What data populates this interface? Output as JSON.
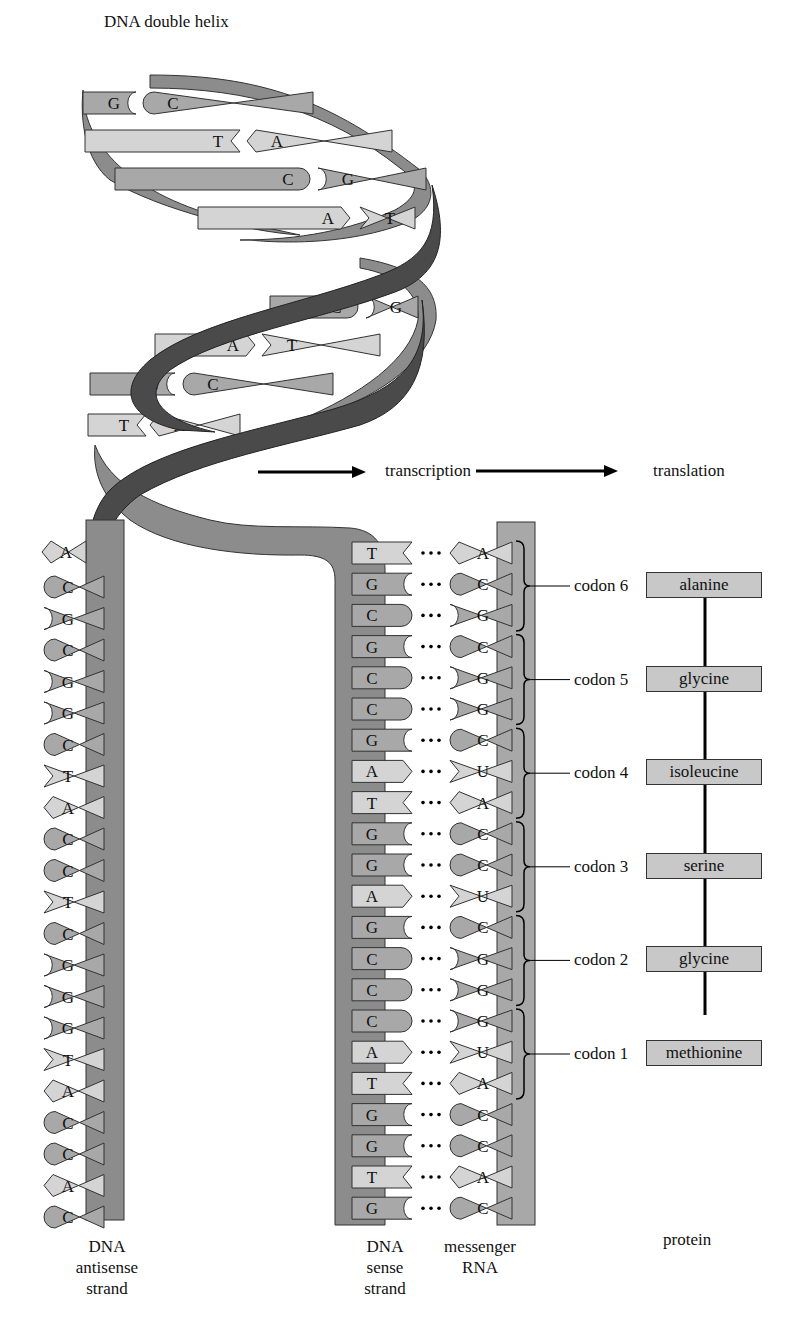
{
  "title": "DNA double helix",
  "flow": {
    "step1": "transcription",
    "step2": "translation"
  },
  "helix_pairs": [
    {
      "left": "G",
      "right": "C"
    },
    {
      "left": "T",
      "right": "A"
    },
    {
      "left": "C",
      "right": "G"
    },
    {
      "left": "A",
      "right": "T"
    },
    {
      "left": "C",
      "right": "G"
    },
    {
      "left": "A",
      "right": "T"
    },
    {
      "left": "G",
      "right": "C"
    },
    {
      "left": "T",
      "right": "A"
    }
  ],
  "antisense_strand": {
    "label_lines": [
      "DNA",
      "antisense",
      "strand"
    ],
    "top_base": "A",
    "bases": [
      "C",
      "G",
      "C",
      "G",
      "G",
      "C",
      "T",
      "A",
      "C",
      "C",
      "T",
      "C",
      "G",
      "G",
      "G",
      "T",
      "A",
      "C",
      "C",
      "A",
      "C"
    ]
  },
  "sense_strand": {
    "label_lines": [
      "DNA",
      "sense",
      "strand"
    ],
    "bases": [
      "T",
      "G",
      "C",
      "G",
      "C",
      "C",
      "G",
      "A",
      "T",
      "G",
      "G",
      "A",
      "G",
      "C",
      "C",
      "C",
      "A",
      "T",
      "G",
      "G",
      "T",
      "G"
    ]
  },
  "mrna": {
    "label_lines": [
      "messenger",
      "RNA"
    ],
    "bases": [
      "A",
      "C",
      "G",
      "C",
      "G",
      "G",
      "C",
      "U",
      "A",
      "C",
      "C",
      "U",
      "C",
      "G",
      "G",
      "G",
      "U",
      "A",
      "C",
      "C",
      "A",
      "C"
    ]
  },
  "codons": [
    {
      "label": "codon 6",
      "amino_acid": "alanine"
    },
    {
      "label": "codon 5",
      "amino_acid": "glycine"
    },
    {
      "label": "codon 4",
      "amino_acid": "isoleucine"
    },
    {
      "label": "codon 3",
      "amino_acid": "serine"
    },
    {
      "label": "codon 2",
      "amino_acid": "glycine"
    },
    {
      "label": "codon 1",
      "amino_acid": "methionine"
    }
  ],
  "protein_label": "protein",
  "colors": {
    "backbone_dark": "#4a4a4a",
    "backbone_mid": "#8c8c8c",
    "purine_gc": "#a8a8a8",
    "pyrimidine_at": "#d4d4d4",
    "outline": "#333333"
  }
}
